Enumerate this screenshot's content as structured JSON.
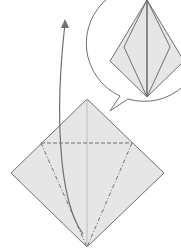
{
  "diagram": {
    "type": "origami-step",
    "colors": {
      "paper": "#e6e6e6",
      "line": "#707070",
      "background": "#ffffff"
    },
    "elements": [
      "square-diamond",
      "valley-fold-horizontal",
      "mountain-folds-diagonal",
      "lift-arrow",
      "result-bubble",
      "result-kite"
    ]
  }
}
